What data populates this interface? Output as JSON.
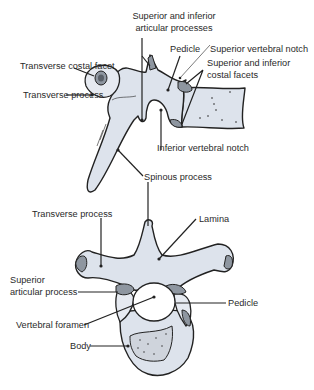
{
  "diagram": {
    "lateral_view": {
      "labels": {
        "articular_processes_line1": "Superior and inferior",
        "articular_processes_line2": "articular processes",
        "pedicle": "Pedicle",
        "superior_vertebral_notch": "Superior vertebral notch",
        "costal_facets_line1": "Superior and inferior",
        "costal_facets_line2": "costal facets",
        "transverse_costal_facet": "Transverse costal facet",
        "transverse_process": "Transverse process",
        "inferior_vertebral_notch": "Inferior vertebral notch",
        "spinous_process": "Spinous process"
      }
    },
    "superior_view": {
      "labels": {
        "transverse_process": "Transverse process",
        "lamina": "Lamina",
        "superior_articular_line1": "Superior",
        "superior_articular_line2": "articular process",
        "pedicle": "Pedicle",
        "vertebral_foramen": "Vertebral foramen",
        "body": "Body"
      }
    },
    "colors": {
      "bone_fill": "#dde3ec",
      "facet_fill": "#8e96a0",
      "outline": "#222222",
      "text": "#2a2a2a"
    }
  }
}
